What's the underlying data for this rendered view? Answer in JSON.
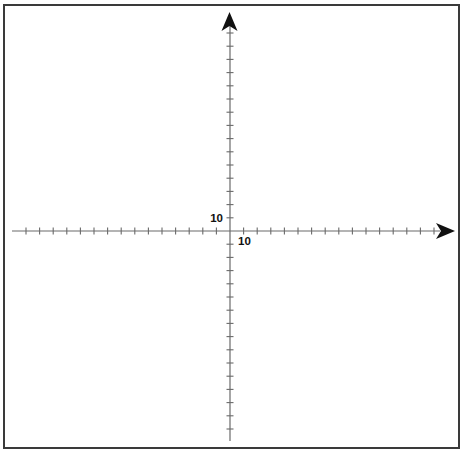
{
  "diagram": {
    "type": "coordinate-plane",
    "origin_px": {
      "x": 230,
      "y": 231
    },
    "tick_spacing_px": {
      "x": 13.6,
      "y": 13.2
    },
    "x_axis": {
      "ticks_left": 15,
      "ticks_right": 15,
      "scale_label": "10",
      "has_arrow_positive": true
    },
    "y_axis": {
      "ticks_up": 15,
      "ticks_down": 15,
      "scale_label": "10",
      "has_arrow_positive": true
    },
    "colors": {
      "axis": "#6a6a6a",
      "arrow": "#111111",
      "border": "#3a3a3a",
      "label": "#111111"
    }
  }
}
